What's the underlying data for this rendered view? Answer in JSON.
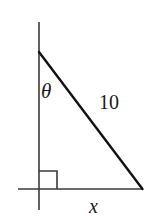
{
  "figure": {
    "kind": "right-triangle-diagram",
    "background_color": "#ffffff",
    "stroke_color": "#1a1a1a",
    "labels": {
      "angle": "θ",
      "hypotenuse": "10",
      "base": "x"
    },
    "geometry": {
      "apex": [
        39,
        52
      ],
      "right_angle_vertex": [
        39,
        189
      ],
      "base_vertex": [
        142,
        189
      ],
      "vertical_line": {
        "x": 39,
        "y1": 22,
        "y2": 210
      },
      "horizontal_line": {
        "y": 189,
        "x1": 18,
        "x2": 143
      },
      "right_angle_marker": {
        "x": 39,
        "y": 171,
        "size": 18
      }
    }
  }
}
